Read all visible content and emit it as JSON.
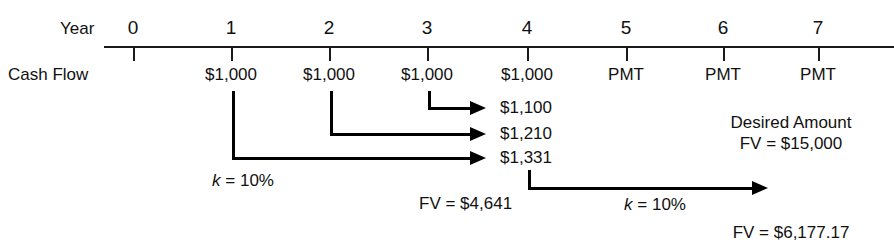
{
  "diagram": {
    "colors": {
      "ink": "#000000",
      "axis": "#1a1a1a",
      "background": "#ffffff"
    },
    "row_labels": {
      "year": "Year",
      "cash_flow": "Cash Flow"
    },
    "timeline": {
      "tick_labels": [
        "0",
        "1",
        "2",
        "3",
        "4",
        "5",
        "6",
        "7"
      ],
      "cash_flows": [
        "",
        "$1,000",
        "$1,000",
        "$1,000",
        "$1,000",
        "PMT",
        "PMT",
        "PMT"
      ]
    },
    "compounded_values": [
      {
        "label": "$1,100",
        "from_year": 3,
        "to_year": 4
      },
      {
        "label": "$1,210",
        "from_year": 2,
        "to_year": 4
      },
      {
        "label": "$1,331",
        "from_year": 1,
        "to_year": 4
      }
    ],
    "rate_labels": {
      "left": {
        "k": "k",
        "eq": " = ",
        "value": "10%"
      },
      "right": {
        "k": "k",
        "eq": " = ",
        "value": "10%"
      }
    },
    "fv_annuity": "FV = $4,641",
    "desired": {
      "caption": "Desired Amount",
      "value": "FV = $15,000"
    },
    "fv_future": "FV = $6,177.17"
  }
}
